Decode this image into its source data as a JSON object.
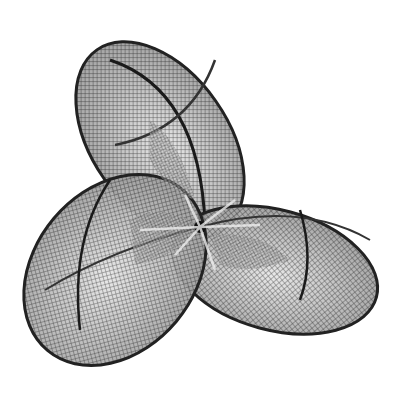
{
  "image": {
    "subject": "wireframe mesh drawing of a three-lobed surface (Boy's surface)",
    "style": "grayscale stippled engraving",
    "background": "#ffffff",
    "ink": "#1a1a1a",
    "mid_tone": "#8a8a8a",
    "lobes": 3,
    "center": [
      200,
      227
    ]
  }
}
